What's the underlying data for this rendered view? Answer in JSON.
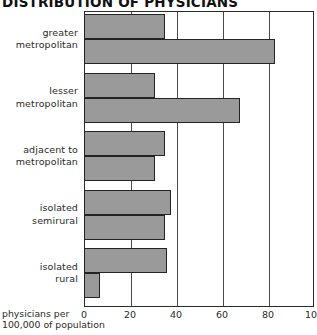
{
  "chart_data": {
    "type": "bar",
    "orientation": "horizontal",
    "title": "DISTRIBUTION OF PHYSICIANS",
    "xlabel_lines": [
      "physicians per",
      "100,000 of population"
    ],
    "ylabel": "",
    "xlim": [
      0,
      100
    ],
    "xticks": [
      0,
      20,
      40,
      60,
      80,
      100
    ],
    "xtick_labels": [
      "0",
      "20",
      "40",
      "60",
      "80",
      "100"
    ],
    "grid": true,
    "legend": "none",
    "categories": [
      "greater metropolitan",
      "lesser metropolitan",
      "adjacent to metropolitan",
      "isolated semirural",
      "isolated rural"
    ],
    "category_label_lines": [
      [
        "greater",
        "metropolitan"
      ],
      [
        "lesser",
        "metropolitan"
      ],
      [
        "adjacent to",
        "metropolitan"
      ],
      [
        "isolated",
        "semirural"
      ],
      [
        "isolated",
        "rural"
      ]
    ],
    "series": [
      {
        "name": "series-1",
        "values": [
          35,
          31,
          35,
          38,
          36
        ]
      },
      {
        "name": "series-2",
        "values": [
          83,
          68,
          31,
          35,
          7
        ]
      }
    ],
    "bar_color": "#9a9a9a",
    "bar_edge_color": "#242424",
    "frame_color": "#2b2b2b",
    "gridline_color": "#4a4a4a"
  }
}
